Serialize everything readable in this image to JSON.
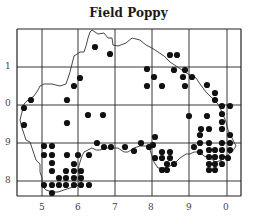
{
  "title": "Field Poppy",
  "axes": {
    "x_labels": [
      {
        "label": "5",
        "x": 42
      },
      {
        "label": "6",
        "x": 78
      },
      {
        "label": "7",
        "x": 115
      },
      {
        "label": "8",
        "x": 151
      },
      {
        "label": "9",
        "x": 189
      },
      {
        "label": "0",
        "x": 226
      }
    ],
    "y_labels": [
      {
        "label": "1",
        "y": 67
      },
      {
        "label": "0",
        "y": 104
      },
      {
        "label": "9",
        "y": 143
      },
      {
        "label": "8",
        "y": 181
      }
    ]
  },
  "grid": {
    "frame": {
      "x1": 17,
      "y1": 29,
      "x2": 241,
      "y2": 196
    },
    "v_lines": [
      42,
      78,
      115,
      152,
      189,
      227
    ],
    "h_lines": [
      67,
      105,
      143,
      181
    ]
  },
  "colors": {
    "dot": "#111111",
    "grid": "#222222",
    "coast": "#333333"
  },
  "coastline": "M92,30 L98,34 L104,33 L108,38 L112,38 L113,45 L118,46 L126,43 L132,38 L140,40 L146,45 L152,48 L158,52 L164,56 L170,62 L176,66 L182,70 L188,74 L196,78 L200,84 L206,92 L212,98 L218,104 L222,112 L226,122 L228,130 L232,138 L236,146 L232,152 L226,156 L222,160 L216,162 L210,158 L204,156 L200,152 L194,152 L190,154 L186,154 L180,158 L176,162 L170,166 L164,168 L158,168 L154,162 L152,156 L150,150 L146,146 L140,146 L134,148 L128,152 L124,152 L118,148 L112,148 L106,148 L100,150 L96,150 L92,148 L88,150 L84,152 L82,156 L80,162 L78,170 L80,178 L82,184 L76,186 L70,188 L64,190 L58,192 L52,192 L46,190 L42,186 L42,178 L40,172 L40,164 L36,160 L34,154 L32,148 L30,142 L26,140 L24,134 L22,128 L20,120 L22,112 L24,104 L28,100 L34,96 L38,90 L40,86 L44,84 L52,84 L60,86 L66,84 L68,78 L70,72 L72,64 L74,56 L80,52 L84,52 L86,46 L88,38 L90,32 Z",
  "chart_data": {
    "type": "scatter",
    "title": "Field Poppy",
    "xlabel": "",
    "ylabel": "",
    "x_ticks": [
      "5",
      "6",
      "7",
      "8",
      "9",
      "0"
    ],
    "y_ticks": [
      "1",
      "0",
      "9",
      "8"
    ],
    "points": [
      [
        95,
        47
      ],
      [
        110,
        54
      ],
      [
        80,
        78
      ],
      [
        74,
        86
      ],
      [
        24,
        108
      ],
      [
        31,
        100
      ],
      [
        67,
        100
      ],
      [
        67,
        123
      ],
      [
        88,
        115
      ],
      [
        103,
        115
      ],
      [
        24,
        125
      ],
      [
        170,
        55
      ],
      [
        177,
        55
      ],
      [
        147,
        69
      ],
      [
        174,
        70
      ],
      [
        185,
        70
      ],
      [
        154,
        77
      ],
      [
        183,
        77
      ],
      [
        192,
        77
      ],
      [
        147,
        86
      ],
      [
        162,
        86
      ],
      [
        185,
        86
      ],
      [
        207,
        85
      ],
      [
        215,
        93
      ],
      [
        215,
        100
      ],
      [
        222,
        106
      ],
      [
        230,
        106
      ],
      [
        207,
        116
      ],
      [
        222,
        114
      ],
      [
        222,
        122
      ],
      [
        222,
        129
      ],
      [
        230,
        135
      ],
      [
        200,
        135
      ],
      [
        189,
        116
      ],
      [
        201,
        129
      ],
      [
        209,
        129
      ],
      [
        44,
        146
      ],
      [
        52,
        146
      ],
      [
        44,
        155
      ],
      [
        52,
        155
      ],
      [
        52,
        163
      ],
      [
        52,
        171
      ],
      [
        67,
        155
      ],
      [
        78,
        155
      ],
      [
        89,
        155
      ],
      [
        74,
        164
      ],
      [
        74,
        171
      ],
      [
        81,
        171
      ],
      [
        44,
        185
      ],
      [
        52,
        185
      ],
      [
        59,
        185
      ],
      [
        66,
        185
      ],
      [
        74,
        185
      ],
      [
        81,
        185
      ],
      [
        89,
        185
      ],
      [
        59,
        178
      ],
      [
        66,
        178
      ],
      [
        74,
        178
      ],
      [
        81,
        178
      ],
      [
        66,
        171
      ],
      [
        52,
        193
      ],
      [
        97,
        143
      ],
      [
        104,
        147
      ],
      [
        111,
        147
      ],
      [
        125,
        147
      ],
      [
        134,
        151
      ],
      [
        141,
        143
      ],
      [
        149,
        147
      ],
      [
        155,
        137
      ],
      [
        153,
        145
      ],
      [
        155,
        158
      ],
      [
        162,
        152
      ],
      [
        162,
        158
      ],
      [
        170,
        152
      ],
      [
        170,
        158
      ],
      [
        167,
        164
      ],
      [
        174,
        164
      ],
      [
        162,
        170
      ],
      [
        167,
        170
      ],
      [
        194,
        147
      ],
      [
        200,
        143
      ],
      [
        209,
        143
      ],
      [
        209,
        150
      ],
      [
        209,
        157
      ],
      [
        215,
        150
      ],
      [
        215,
        157
      ],
      [
        222,
        143
      ],
      [
        222,
        150
      ],
      [
        222,
        157
      ],
      [
        230,
        143
      ],
      [
        230,
        150
      ],
      [
        228,
        158
      ],
      [
        215,
        164
      ],
      [
        222,
        164
      ],
      [
        209,
        164
      ],
      [
        215,
        170
      ],
      [
        209,
        170
      ],
      [
        200,
        152
      ]
    ]
  }
}
